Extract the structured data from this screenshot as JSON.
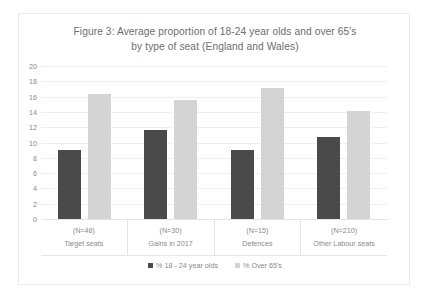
{
  "chart_data": {
    "type": "bar",
    "title": "Figure 3: Average proportion of 18-24 year olds and over 65's by type of seat (England and Wales)",
    "title_lines": [
      "Figure 3: Average proportion of 18-24 year olds and over 65's",
      "by type of seat (England and Wales)"
    ],
    "categories": [
      "Target seats",
      "Gains in 2017",
      "Defences",
      "Other Labour seats"
    ],
    "category_counts": [
      "(N=48)",
      "(N=30)",
      "(N=15)",
      "(N=210)"
    ],
    "series": [
      {
        "name": "% 18 - 24 year olds",
        "values": [
          9.0,
          11.6,
          9.0,
          10.7
        ],
        "color": "#4a4a4a"
      },
      {
        "name": "% Over 65's",
        "values": [
          16.4,
          15.6,
          17.1,
          14.1
        ],
        "color": "#d4d4d4"
      }
    ],
    "xlabel": "",
    "ylabel": "",
    "ylim": [
      0,
      20
    ],
    "y_ticks": [
      0,
      2,
      4,
      6,
      8,
      10,
      12,
      14,
      16,
      18,
      20
    ],
    "grid": true,
    "legend_position": "bottom"
  }
}
